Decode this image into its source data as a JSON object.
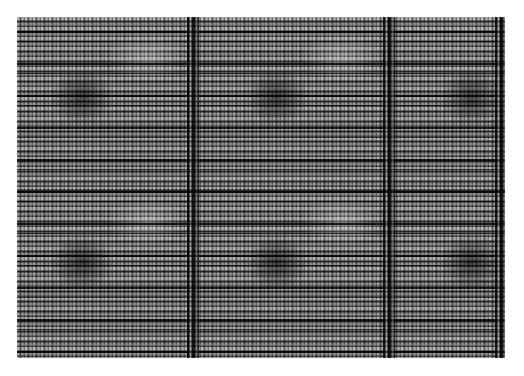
{
  "image": {
    "kind": "grayscale-texture",
    "description": "Woven/grid-like grayscale texture with horizontal stripes, fine dotted columns, dark vertical bands and a 3x2 tiled repeating blotch pattern",
    "palette": {
      "background": "#ffffff",
      "mid_gray": "#8a8a8a",
      "dark": "#000000",
      "light": "#e6e6e6"
    },
    "tiles": {
      "columns": 3,
      "rows": 2
    }
  }
}
